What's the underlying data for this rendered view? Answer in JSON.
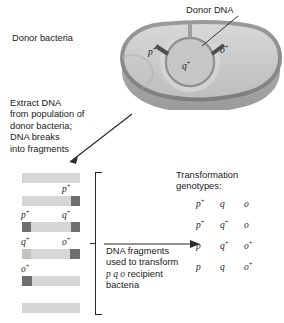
{
  "figure": {
    "type": "biology-diagram",
    "donor_label": "Donor bacteria",
    "donor_dna_label": "Donor DNA",
    "extract_text": "Extract DNA\nfrom population of\ndonor bacteria;\nDNA breaks\ninto fragments",
    "fragments_text_line1": "DNA fragments",
    "fragments_text_line2": "used to transform",
    "fragments_text_line3_genotype": "p q o",
    "fragments_text_line3_rest": " recipient",
    "fragments_text_line4": "bacteria",
    "genotypes_heading_line1": "Transformation",
    "genotypes_heading_line2": "genotypes:"
  },
  "chromosome": {
    "markers": [
      {
        "name": "p-plus",
        "base": "p",
        "sup": "+"
      },
      {
        "name": "q-plus",
        "base": "q",
        "sup": "+"
      },
      {
        "name": "o-plus",
        "base": "o",
        "sup": "+"
      }
    ]
  },
  "fragments": [
    {
      "id": 1,
      "bands": [],
      "labels": []
    },
    {
      "id": 2,
      "bands": [
        {
          "marker": "p",
          "sup": "+",
          "pos": "right",
          "shade": "dark"
        }
      ],
      "labels": [
        {
          "base": "p",
          "sup": "+",
          "side": "right"
        }
      ]
    },
    {
      "id": 3,
      "bands": [
        {
          "marker": "p",
          "sup": "+",
          "pos": "left",
          "shade": "dark"
        },
        {
          "marker": "q",
          "sup": "+",
          "pos": "right",
          "shade": "dark"
        }
      ],
      "labels": [
        {
          "base": "p",
          "sup": "+",
          "side": "left"
        },
        {
          "base": "q",
          "sup": "+",
          "side": "right"
        }
      ]
    },
    {
      "id": 4,
      "bands": [
        {
          "marker": "q",
          "sup": "+",
          "pos": "left",
          "shade": "light"
        },
        {
          "marker": "o",
          "sup": "+",
          "pos": "right",
          "shade": "dark"
        }
      ],
      "labels": [
        {
          "base": "q",
          "sup": "+",
          "side": "left"
        },
        {
          "base": "o",
          "sup": "+",
          "side": "right"
        }
      ]
    },
    {
      "id": 5,
      "bands": [
        {
          "marker": "o",
          "sup": "+",
          "pos": "left",
          "shade": "dark"
        }
      ],
      "labels": [
        {
          "base": "o",
          "sup": "+",
          "side": "left"
        }
      ]
    },
    {
      "id": 6,
      "bands": [],
      "labels": []
    }
  ],
  "genotype_rows": [
    {
      "p": "p",
      "p_sup": "+",
      "q": "q",
      "q_sup": "",
      "o": "o",
      "o_sup": ""
    },
    {
      "p": "p",
      "p_sup": "+",
      "q": "q",
      "q_sup": "+",
      "o": "o",
      "o_sup": ""
    },
    {
      "p": "p",
      "p_sup": "",
      "q": "q",
      "q_sup": "+",
      "o": "o",
      "o_sup": "+"
    },
    {
      "p": "p",
      "p_sup": "",
      "q": "q",
      "q_sup": "",
      "o": "o",
      "o_sup": "+"
    }
  ],
  "colors": {
    "cell_body": "#c9c9c9",
    "cell_rim": "#8e8e8e",
    "cell_side": "#a8a8a8",
    "fragment_base": "#d6d6d6",
    "band_dark": "#6f6f6f",
    "band_light": "#c2c2c2",
    "text": "#1a1a1a",
    "line": "#2b2b2b"
  }
}
